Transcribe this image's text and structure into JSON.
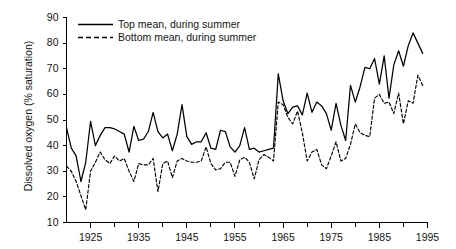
{
  "chart_data": {
    "type": "line",
    "title": "",
    "xlabel": "",
    "ylabel": "Dissolved oxygen (% saturation)",
    "xlim": [
      1920,
      1995
    ],
    "ylim": [
      10,
      90
    ],
    "ytick_step": 10,
    "xtick_step": 10,
    "x_minor_tick_step": 5,
    "grid": false,
    "legend_position": "top-left-inside",
    "y_ticks": [
      10,
      20,
      30,
      40,
      50,
      60,
      70,
      80,
      90
    ],
    "x_ticks": [
      1925,
      1935,
      1945,
      1955,
      1965,
      1975,
      1985,
      1995
    ],
    "x_minor_ticks": [
      1920,
      1930,
      1940,
      1950,
      1960,
      1970,
      1980,
      1990
    ],
    "x": [
      1920,
      1921,
      1922,
      1923,
      1924,
      1925,
      1926,
      1927,
      1928,
      1929,
      1930,
      1931,
      1932,
      1933,
      1934,
      1935,
      1936,
      1937,
      1938,
      1939,
      1940,
      1941,
      1942,
      1943,
      1944,
      1945,
      1946,
      1947,
      1948,
      1949,
      1950,
      1951,
      1952,
      1953,
      1954,
      1955,
      1956,
      1957,
      1958,
      1959,
      1960,
      1961,
      1962,
      1963,
      1964,
      1965,
      1966,
      1967,
      1968,
      1969,
      1970,
      1971,
      1972,
      1973,
      1974,
      1975,
      1976,
      1977,
      1978,
      1979,
      1980,
      1981,
      1982,
      1983,
      1984,
      1985,
      1986,
      1987,
      1988,
      1989,
      1990,
      1991,
      1992,
      1993,
      1994
    ],
    "series": [
      {
        "name": "Top mean, during summer",
        "style": "solid",
        "color": "#000000",
        "values": [
          47.0,
          39.0,
          36.0,
          26.0,
          33.5,
          49.5,
          40.0,
          44.0,
          47.0,
          47.0,
          46.5,
          45.5,
          44.5,
          37.5,
          47.5,
          42.0,
          42.5,
          45.5,
          53.0,
          45.5,
          43.0,
          44.5,
          38.0,
          44.5,
          56.0,
          43.5,
          40.5,
          41.5,
          41.5,
          45.0,
          39.0,
          38.5,
          46.0,
          45.5,
          39.5,
          37.5,
          40.0,
          47.0,
          38.5,
          39.0,
          37.5,
          38.0,
          38.5,
          39.0,
          68.0,
          57.5,
          52.5,
          55.0,
          55.5,
          52.0,
          60.5,
          53.0,
          57.0,
          55.5,
          52.5,
          46.0,
          56.5,
          48.0,
          42.0,
          63.5,
          57.0,
          63.0,
          70.5,
          70.0,
          74.0,
          64.0,
          75.0,
          58.5,
          71.5,
          77.0,
          71.0,
          79.0,
          84.0,
          80.0,
          76.0
        ]
      },
      {
        "name": "Bottom mean, during summer",
        "style": "dashed",
        "color": "#000000",
        "values": [
          32.0,
          30.0,
          26.0,
          20.5,
          15.0,
          30.0,
          33.5,
          37.5,
          34.5,
          33.0,
          36.0,
          34.0,
          35.0,
          30.0,
          26.0,
          33.0,
          32.5,
          32.5,
          35.0,
          22.0,
          33.0,
          34.0,
          27.5,
          34.0,
          35.0,
          34.0,
          33.5,
          33.5,
          34.0,
          39.5,
          33.0,
          30.5,
          31.0,
          33.5,
          33.5,
          28.0,
          34.5,
          35.5,
          33.5,
          27.0,
          34.5,
          36.5,
          35.5,
          34.0,
          57.0,
          56.0,
          51.0,
          48.5,
          53.5,
          45.0,
          34.0,
          37.5,
          38.5,
          32.5,
          31.0,
          36.0,
          41.5,
          34.0,
          35.0,
          40.5,
          48.5,
          45.0,
          44.0,
          43.5,
          58.5,
          60.0,
          56.5,
          57.0,
          52.5,
          60.5,
          48.5,
          57.5,
          56.5,
          67.5,
          63.5
        ]
      }
    ],
    "legend": [
      {
        "label": "Top mean, during summer",
        "style": "solid"
      },
      {
        "label": "Bottom mean, during summer",
        "style": "dashed"
      }
    ],
    "axis_color": "#000000"
  }
}
